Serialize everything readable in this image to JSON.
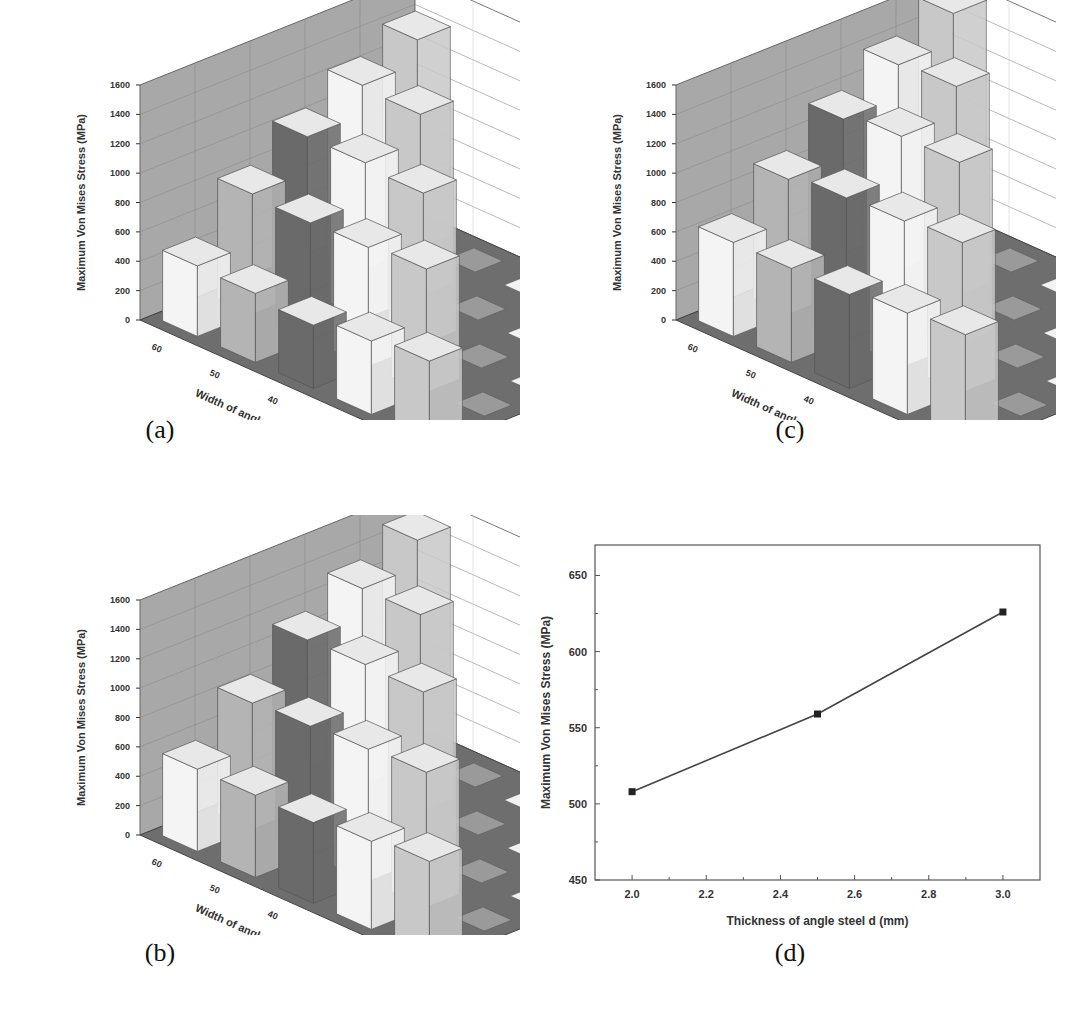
{
  "figure": {
    "captions": [
      "(a)",
      "(b)",
      "(c)",
      "(d)"
    ]
  },
  "chart_data": [
    {
      "id": "a",
      "type": "bar3d",
      "title": "",
      "zlabel": "Maximum Von Mises Stress (MPa)",
      "xlabel": "Width of angle steel L (mm)",
      "ylabel": "overlap distance L1 (mm)",
      "x_ticks": [
        "60",
        "50",
        "40",
        "30",
        "20"
      ],
      "y_ticks": [
        "10",
        "20",
        "30",
        "40",
        "50"
      ],
      "z_ticks": [
        "0",
        "200",
        "400",
        "600",
        "800",
        "1000",
        "1200",
        "1400",
        "1600"
      ],
      "zlim": [
        0,
        1600
      ],
      "bars": [
        {
          "x": "60",
          "y": "50",
          "value": 480,
          "shade": "white"
        },
        {
          "x": "60",
          "y": "40",
          "value": 820,
          "shade": "gray"
        },
        {
          "x": "60",
          "y": "30",
          "value": 1060,
          "shade": "dark"
        },
        {
          "x": "60",
          "y": "20",
          "value": 1260,
          "shade": "white"
        },
        {
          "x": "60",
          "y": "10",
          "value": 1420,
          "shade": "light"
        },
        {
          "x": "50",
          "y": "50",
          "value": 470,
          "shade": "gray"
        },
        {
          "x": "50",
          "y": "40",
          "value": 800,
          "shade": "dark"
        },
        {
          "x": "50",
          "y": "30",
          "value": 1060,
          "shade": "white"
        },
        {
          "x": "50",
          "y": "20",
          "value": 1240,
          "shade": "light"
        },
        {
          "x": "40",
          "y": "50",
          "value": 430,
          "shade": "dark"
        },
        {
          "x": "40",
          "y": "40",
          "value": 810,
          "shade": "white"
        },
        {
          "x": "40",
          "y": "30",
          "value": 1030,
          "shade": "light"
        },
        {
          "x": "30",
          "y": "50",
          "value": 500,
          "shade": "white"
        },
        {
          "x": "30",
          "y": "40",
          "value": 840,
          "shade": "light"
        },
        {
          "x": "20",
          "y": "50",
          "value": 540,
          "shade": "light"
        }
      ]
    },
    {
      "id": "b",
      "type": "bar3d",
      "title": "",
      "zlabel": "Maximum Von Mises Stress (MPa)",
      "xlabel": "Width of angle steel L (mm)",
      "ylabel": "overlap distance L1 (mm)",
      "x_ticks": [
        "60",
        "50",
        "40",
        "30",
        "20"
      ],
      "y_ticks": [
        "10",
        "20",
        "30",
        "40",
        "50"
      ],
      "z_ticks": [
        "0",
        "200",
        "400",
        "600",
        "800",
        "1000",
        "1200",
        "1400",
        "1600"
      ],
      "zlim": [
        0,
        1600
      ],
      "bars": [
        {
          "x": "60",
          "y": "50",
          "value": 560,
          "shade": "white"
        },
        {
          "x": "60",
          "y": "40",
          "value": 860,
          "shade": "gray"
        },
        {
          "x": "60",
          "y": "30",
          "value": 1140,
          "shade": "dark"
        },
        {
          "x": "60",
          "y": "20",
          "value": 1340,
          "shade": "white"
        },
        {
          "x": "60",
          "y": "10",
          "value": 1520,
          "shade": "light"
        },
        {
          "x": "50",
          "y": "50",
          "value": 560,
          "shade": "gray"
        },
        {
          "x": "50",
          "y": "40",
          "value": 880,
          "shade": "dark"
        },
        {
          "x": "50",
          "y": "30",
          "value": 1150,
          "shade": "white"
        },
        {
          "x": "50",
          "y": "20",
          "value": 1340,
          "shade": "light"
        },
        {
          "x": "40",
          "y": "50",
          "value": 550,
          "shade": "dark"
        },
        {
          "x": "40",
          "y": "40",
          "value": 900,
          "shade": "white"
        },
        {
          "x": "40",
          "y": "30",
          "value": 1140,
          "shade": "light"
        },
        {
          "x": "30",
          "y": "50",
          "value": 600,
          "shade": "white"
        },
        {
          "x": "30",
          "y": "40",
          "value": 920,
          "shade": "light"
        },
        {
          "x": "20",
          "y": "50",
          "value": 640,
          "shade": "light"
        }
      ]
    },
    {
      "id": "c",
      "type": "bar3d",
      "title": "",
      "zlabel": "Maximum Von Mises Stress (MPa)",
      "xlabel": "Width of angle steel L (mm)",
      "ylabel": "overlap distance L1 (mm)",
      "x_ticks": [
        "60",
        "50",
        "40",
        "30",
        "20"
      ],
      "y_ticks": [
        "10",
        "20",
        "30",
        "40",
        "50"
      ],
      "z_ticks": [
        "0",
        "200",
        "400",
        "600",
        "800",
        "1000",
        "1200",
        "1400",
        "1600"
      ],
      "zlim": [
        0,
        1600
      ],
      "bars": [
        {
          "x": "60",
          "y": "50",
          "value": 640,
          "shade": "white"
        },
        {
          "x": "60",
          "y": "40",
          "value": 920,
          "shade": "gray"
        },
        {
          "x": "60",
          "y": "30",
          "value": 1180,
          "shade": "dark"
        },
        {
          "x": "60",
          "y": "20",
          "value": 1400,
          "shade": "white"
        },
        {
          "x": "60",
          "y": "10",
          "value": 1600,
          "shade": "light"
        },
        {
          "x": "50",
          "y": "50",
          "value": 640,
          "shade": "gray"
        },
        {
          "x": "50",
          "y": "40",
          "value": 970,
          "shade": "dark"
        },
        {
          "x": "50",
          "y": "30",
          "value": 1240,
          "shade": "white"
        },
        {
          "x": "50",
          "y": "20",
          "value": 1430,
          "shade": "light"
        },
        {
          "x": "40",
          "y": "50",
          "value": 640,
          "shade": "dark"
        },
        {
          "x": "40",
          "y": "40",
          "value": 990,
          "shade": "white"
        },
        {
          "x": "40",
          "y": "30",
          "value": 1240,
          "shade": "light"
        },
        {
          "x": "30",
          "y": "50",
          "value": 690,
          "shade": "white"
        },
        {
          "x": "30",
          "y": "40",
          "value": 1020,
          "shade": "light"
        },
        {
          "x": "20",
          "y": "50",
          "value": 720,
          "shade": "light"
        }
      ]
    },
    {
      "id": "d",
      "type": "line",
      "title": "",
      "xlabel": "Thickness of angle steel d (mm)",
      "ylabel": "Maximum Von Mises Stress (MPa)",
      "x": [
        2.0,
        2.5,
        3.0
      ],
      "series": [
        {
          "name": "Maximum Von Mises Stress",
          "values": [
            508,
            559,
            626
          ],
          "marker": "square",
          "color": "#333333"
        }
      ],
      "x_ticks": [
        "2.0",
        "2.2",
        "2.4",
        "2.6",
        "2.8",
        "3.0"
      ],
      "y_ticks": [
        "450",
        "500",
        "550",
        "600",
        "650"
      ],
      "xlim": [
        1.9,
        3.1
      ],
      "ylim": [
        450,
        670
      ],
      "grid": false,
      "legend": null
    }
  ],
  "colors": {
    "wall": "#a8a8a8",
    "floor": "#6e6e6e",
    "bar_white": "#f4f4f4",
    "bar_light": "#c8c8c8",
    "bar_gray": "#b4b4b4",
    "bar_dark": "#6a6a6a",
    "line": "#444444"
  }
}
